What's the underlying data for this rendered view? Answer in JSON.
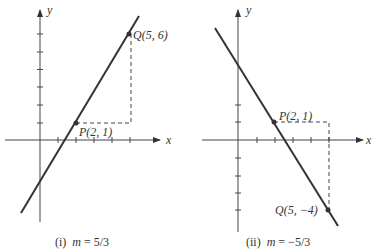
{
  "panels": [
    {
      "id": "i",
      "axis_x_label": "x",
      "axis_y_label": "y",
      "point_p": {
        "label": "P(2, 1)",
        "x": 2,
        "y": 1
      },
      "point_q": {
        "label": "Q(5, 6)",
        "x": 5,
        "y": 6
      },
      "caption_prefix": "(i)",
      "caption_var": "m",
      "caption_value": "= 5/3",
      "slope": "5/3"
    },
    {
      "id": "ii",
      "axis_x_label": "x",
      "axis_y_label": "y",
      "point_p": {
        "label": "P(2, 1)",
        "x": 2,
        "y": 1
      },
      "point_q": {
        "label": "Q(5, −4)",
        "x": 5,
        "y": -4
      },
      "caption_prefix": "(ii)",
      "caption_var": "m",
      "caption_value": "= −5/3",
      "slope": "-5/3"
    }
  ],
  "colors": {
    "line": "#333333",
    "axis": "#444444",
    "dashed": "#444444"
  }
}
